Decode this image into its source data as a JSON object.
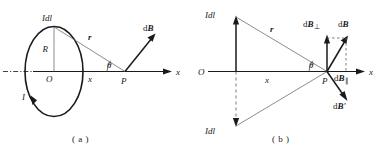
{
  "figure": {
    "panels": [
      {
        "id": "a",
        "caption": "( a )",
        "labels": {
          "current_element": "Idl",
          "radius": "R",
          "origin": "O",
          "distance_r": "r",
          "distance_x": "x",
          "angle": "θ",
          "point": "P",
          "axis": "x",
          "current": "I",
          "field": "dB"
        }
      },
      {
        "id": "b",
        "caption": "( b )",
        "labels": {
          "current_element_top": "Idl",
          "current_element_bottom": "Idl",
          "origin": "O",
          "distance_r": "r",
          "distance_x": "x",
          "angle": "θ",
          "point": "P",
          "axis": "x",
          "field": "dB",
          "field_perp": "dB",
          "field_perp_sub": "⊥",
          "field_par": "dB",
          "field_par_sub": "∥",
          "field_prime": "dB’"
        }
      }
    ],
    "colors": {
      "ink": "#1a1a1a",
      "background": "#ffffff",
      "thin_line": "#5a5a5a"
    }
  }
}
